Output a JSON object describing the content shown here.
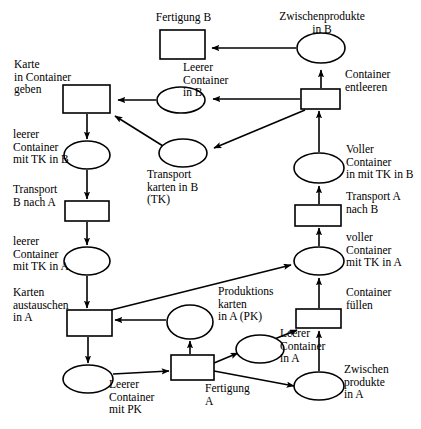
{
  "diagram": {
    "type": "petri-net",
    "width": 421,
    "height": 429,
    "stroke_color": "#000000",
    "fill_color": "#ffffff",
    "background": "#ffffff"
  },
  "labels": {
    "fertigung_b": "Fertigung B",
    "zwischenprodukte_in_b": "Zwischenprodukte\nin B",
    "karte_in_container_geben": "Karte\nin Container\ngeben",
    "leerer_container_in_b": "Leerer\nContainer\nin B",
    "container_entleeren": "Container\nentleeren",
    "leerer_container_mit_tk_in_b": "leerer\nContainer\nmit TK in B",
    "transportkarten_in_b": "Transport\nkarten in B\n(TK)",
    "voller_container_mit_tk_in_b": "Voller\nContainer\nin mit TK in B",
    "transport_b_nach_a": "Transport\nB nach A",
    "transport_a_nach_b": "Transport A\nnach B",
    "leerer_container_mit_tk_in_a": "leerer\nContainer\nmit TK in A",
    "voller_container_mit_tk_in_a": "voller\nContainer\nmit TK in A",
    "karten_austauschen_in_a": "Karten\naustauschen\nin A",
    "produktionskarten_in_a": "Produktions\nkarten\nin A (PK)",
    "container_fuellen": "Container\nfüllen",
    "leerer_container_in_a": "Leerer\nContainer\nin A",
    "leerer_container_mit_pk": "Leerer\nContainer\nmit PK",
    "fertigung_a": "Fertigung\nA",
    "zwischenprodukte_in_a": "Zwischen\nprodukte\nin A"
  },
  "nodes": {
    "places": [
      {
        "id": "zwischenprodukte_in_b",
        "kind": "place",
        "cx": 321,
        "cy": 48,
        "rx": 24,
        "ry": 15
      },
      {
        "id": "leerer_container_in_b",
        "kind": "place",
        "cx": 181,
        "cy": 100,
        "rx": 24,
        "ry": 13
      },
      {
        "id": "leerer_container_mit_tk_in_b",
        "kind": "place",
        "cx": 87,
        "cy": 155,
        "rx": 23,
        "ry": 14
      },
      {
        "id": "transportkarten_in_b",
        "kind": "place",
        "cx": 183,
        "cy": 153,
        "rx": 24,
        "ry": 14
      },
      {
        "id": "voller_container_mit_tk_in_b",
        "kind": "place",
        "cx": 319,
        "cy": 168,
        "rx": 25,
        "ry": 15
      },
      {
        "id": "leerer_container_mit_tk_in_a",
        "kind": "place",
        "cx": 87,
        "cy": 261,
        "rx": 23,
        "ry": 14
      },
      {
        "id": "voller_container_mit_tk_in_a",
        "kind": "place",
        "cx": 319,
        "cy": 261,
        "rx": 25,
        "ry": 14
      },
      {
        "id": "produktionskarten_in_a",
        "kind": "place",
        "cx": 190,
        "cy": 322,
        "rx": 23,
        "ry": 17
      },
      {
        "id": "leerer_container_in_a",
        "kind": "place",
        "cx": 260,
        "cy": 349,
        "rx": 24,
        "ry": 14
      },
      {
        "id": "leerer_container_mit_pk",
        "kind": "place",
        "cx": 88,
        "cy": 379,
        "rx": 25,
        "ry": 14
      },
      {
        "id": "zwischenprodukte_in_a",
        "kind": "place",
        "cx": 319,
        "cy": 386,
        "rx": 25,
        "ry": 14
      }
    ],
    "transitions": [
      {
        "id": "fertigung_b",
        "kind": "transition",
        "x": 160,
        "y": 30,
        "w": 45,
        "h": 29
      },
      {
        "id": "karte_in_container_geben",
        "kind": "transition",
        "x": 63,
        "y": 85,
        "w": 47,
        "h": 28
      },
      {
        "id": "container_entleeren",
        "kind": "transition",
        "x": 301,
        "y": 89,
        "w": 39,
        "h": 20
      },
      {
        "id": "transport_b_nach_a",
        "kind": "transition",
        "x": 65,
        "y": 201,
        "w": 44,
        "h": 20
      },
      {
        "id": "transport_a_nach_b",
        "kind": "transition",
        "x": 295,
        "y": 205,
        "w": 46,
        "h": 21
      },
      {
        "id": "karten_austauschen_in_a",
        "kind": "transition",
        "x": 67,
        "y": 310,
        "w": 45,
        "h": 26
      },
      {
        "id": "container_fuellen",
        "kind": "transition",
        "x": 296,
        "y": 309,
        "w": 45,
        "h": 19
      },
      {
        "id": "fertigung_a",
        "kind": "transition",
        "x": 171,
        "y": 355,
        "w": 43,
        "h": 25
      }
    ]
  },
  "arcs": [
    {
      "from": "zwischenprodukte_in_b",
      "to": "fertigung_b"
    },
    {
      "from": "container_entleeren",
      "to": "zwischenprodukte_in_b"
    },
    {
      "from": "container_entleeren",
      "to": "leerer_container_in_b"
    },
    {
      "from": "leerer_container_in_b",
      "to": "karte_in_container_geben"
    },
    {
      "from": "container_entleeren",
      "to": "transportkarten_in_b"
    },
    {
      "from": "transportkarten_in_b",
      "to": "karte_in_container_geben"
    },
    {
      "from": "karte_in_container_geben",
      "to": "leerer_container_mit_tk_in_b"
    },
    {
      "from": "leerer_container_mit_tk_in_b",
      "to": "transport_b_nach_a"
    },
    {
      "from": "transport_b_nach_a",
      "to": "leerer_container_mit_tk_in_a"
    },
    {
      "from": "leerer_container_mit_tk_in_a",
      "to": "karten_austauschen_in_a"
    },
    {
      "from": "karten_austauschen_in_a",
      "to": "leerer_container_mit_pk"
    },
    {
      "from": "produktionskarten_in_a",
      "to": "karten_austauschen_in_a"
    },
    {
      "from": "karten_austauschen_in_a",
      "to": "voller_container_mit_tk_in_a"
    },
    {
      "from": "leerer_container_mit_pk",
      "to": "fertigung_a"
    },
    {
      "from": "fertigung_a",
      "to": "produktionskarten_in_a"
    },
    {
      "from": "fertigung_a",
      "to": "leerer_container_in_a"
    },
    {
      "from": "fertigung_a",
      "to": "zwischenprodukte_in_a"
    },
    {
      "from": "leerer_container_in_a",
      "to": "container_fuellen"
    },
    {
      "from": "zwischenprodukte_in_a",
      "to": "container_fuellen"
    },
    {
      "from": "container_fuellen",
      "to": "voller_container_mit_tk_in_a"
    },
    {
      "from": "voller_container_mit_tk_in_a",
      "to": "transport_a_nach_b"
    },
    {
      "from": "transport_a_nach_b",
      "to": "voller_container_mit_tk_in_b"
    },
    {
      "from": "voller_container_mit_tk_in_b",
      "to": "container_entleeren"
    }
  ],
  "label_positions": [
    {
      "id": "fertigung_b",
      "left": 183,
      "top": 11,
      "align": "ctr"
    },
    {
      "id": "zwischenprodukte_in_b",
      "left": 322,
      "top": 10,
      "align": "ctr"
    },
    {
      "id": "karte_in_container_geben",
      "left": 14,
      "top": 58,
      "align": "lft"
    },
    {
      "id": "leerer_container_in_b",
      "left": 183,
      "top": 61,
      "align": "lft"
    },
    {
      "id": "container_entleeren",
      "left": 345,
      "top": 68,
      "align": "lft"
    },
    {
      "id": "leerer_container_mit_tk_in_b",
      "left": 14,
      "top": 129,
      "align": "lft"
    },
    {
      "id": "transportkarten_in_b",
      "left": 148,
      "top": 168,
      "align": "lft"
    },
    {
      "id": "voller_container_mit_tk_in_b",
      "left": 347,
      "top": 143,
      "align": "lft"
    },
    {
      "id": "transport_b_nach_a",
      "left": 14,
      "top": 184,
      "align": "lft"
    },
    {
      "id": "transport_a_nach_b",
      "left": 347,
      "top": 190,
      "align": "lft"
    },
    {
      "id": "leerer_container_mit_tk_in_a",
      "left": 14,
      "top": 236,
      "align": "lft"
    },
    {
      "id": "voller_container_mit_tk_in_a",
      "left": 347,
      "top": 232,
      "align": "lft"
    },
    {
      "id": "karten_austauschen_in_a",
      "left": 14,
      "top": 287,
      "align": "lft"
    },
    {
      "id": "produktionskarten_in_a",
      "left": 218,
      "top": 285,
      "align": "lft"
    },
    {
      "id": "container_fuellen",
      "left": 347,
      "top": 287,
      "align": "lft"
    },
    {
      "id": "leerer_container_in_a",
      "left": 280,
      "top": 327,
      "align": "lft"
    },
    {
      "id": "leerer_container_mit_pk",
      "left": 110,
      "top": 378,
      "align": "lft"
    },
    {
      "id": "fertigung_a",
      "left": 205,
      "top": 382,
      "align": "lft"
    },
    {
      "id": "zwischenprodukte_in_a",
      "left": 344,
      "top": 364,
      "align": "lft"
    }
  ]
}
